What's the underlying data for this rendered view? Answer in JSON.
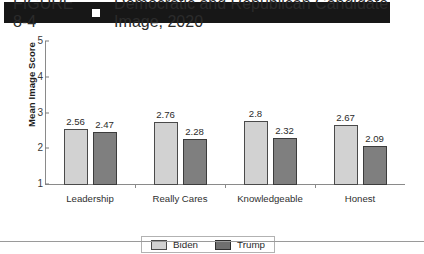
{
  "header": {
    "figure_number": "FIGURE 8-4",
    "separator_icon": "white-square-icon",
    "title": "Democratic and Republican Candidate Image, 2020"
  },
  "legend": {
    "items": [
      {
        "label": "Biden",
        "color": "#d2d2d2"
      },
      {
        "label": "Trump",
        "color": "#7f7f7f"
      }
    ]
  },
  "chart_data": {
    "type": "bar",
    "title": "Democratic and Republican Candidate Image, 2020",
    "xlabel": "",
    "ylabel": "Mean Image Score",
    "ylim": [
      1,
      5
    ],
    "yticks": [
      "1",
      "2",
      "3",
      "4",
      "5"
    ],
    "grid": false,
    "legend_position": "bottom-center",
    "categories": [
      "Leadership",
      "Really Cares",
      "Knowledgeable",
      "Honest"
    ],
    "series": [
      {
        "name": "Biden",
        "color": "#d2d2d2",
        "values": [
          2.56,
          2.76,
          2.8,
          2.67
        ],
        "labels": [
          "2.56",
          "2.76",
          "2.8",
          "2.67"
        ]
      },
      {
        "name": "Trump",
        "color": "#7f7f7f",
        "values": [
          2.47,
          2.28,
          2.32,
          2.09
        ],
        "labels": [
          "2.47",
          "2.28",
          "2.32",
          "2.09"
        ]
      }
    ]
  }
}
